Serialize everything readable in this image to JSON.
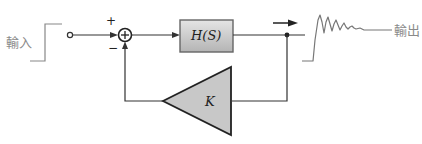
{
  "diagram": {
    "type": "feedback-control-block-diagram",
    "input_label": "輸入",
    "output_label": "輸出",
    "plus_sign": "+",
    "minus_sign": "−",
    "forward_block_label": "H(S)",
    "feedback_block_label": "K",
    "colors": {
      "line": "#333333",
      "block_fill": "#c8c8c8",
      "block_border": "#555555",
      "label_text": "#8a8a8a",
      "signal_curve": "#777777"
    }
  }
}
